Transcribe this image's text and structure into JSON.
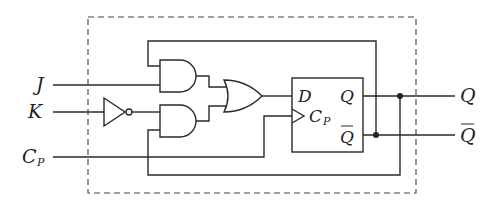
{
  "diagram": {
    "type": "logic-circuit",
    "inputs": [
      {
        "id": "J",
        "label": "J"
      },
      {
        "id": "K",
        "label": "K"
      },
      {
        "id": "CP",
        "label": "C",
        "sub": "P"
      }
    ],
    "outputs": [
      {
        "id": "Q",
        "label": "Q"
      },
      {
        "id": "Qbar",
        "label": "Q",
        "overbar": true
      }
    ],
    "gates": [
      {
        "id": "not1",
        "type": "NOT",
        "input": "K"
      },
      {
        "id": "and1",
        "type": "AND",
        "inputs": [
          "Qbar",
          "J"
        ]
      },
      {
        "id": "and2",
        "type": "AND",
        "inputs": [
          "not1",
          "Q"
        ]
      },
      {
        "id": "or1",
        "type": "OR",
        "inputs": [
          "and1",
          "and2"
        ]
      }
    ],
    "flipflop": {
      "type": "D",
      "pins": {
        "d": "D",
        "q": "Q",
        "qbar": "Q",
        "clk": "C",
        "clk_sub": "P"
      }
    },
    "junctions": [
      "Q",
      "Qbar"
    ]
  }
}
